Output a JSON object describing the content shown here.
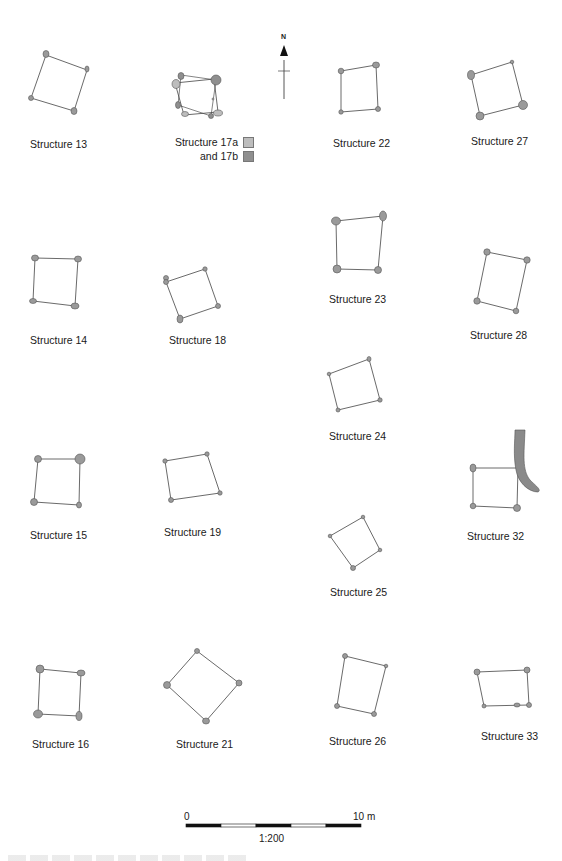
{
  "figure": {
    "north_arrow": {
      "label": "N"
    },
    "colors": {
      "post_fill": "#9a9a9a",
      "post_stroke": "#555555",
      "outline": "#444444",
      "structure_17a": "#bdbdbd",
      "structure_17b": "#8f8f8f",
      "ditch": "#8a8a8a"
    },
    "structures": [
      {
        "id": "13",
        "label": "Structure 13",
        "label_x": 30,
        "label_y": 138
      },
      {
        "id": "17",
        "label": "Structure 17a",
        "label2": "and 17b",
        "label_x": 167,
        "label_y": 137
      },
      {
        "id": "22",
        "label": "Structure 22",
        "label_x": 333,
        "label_y": 137
      },
      {
        "id": "27",
        "label": "Structure 27",
        "label_x": 471,
        "label_y": 135
      },
      {
        "id": "14",
        "label": "Structure 14",
        "label_x": 30,
        "label_y": 334
      },
      {
        "id": "18",
        "label": "Structure 18",
        "label_x": 169,
        "label_y": 334
      },
      {
        "id": "23",
        "label": "Structure 23",
        "label_x": 329,
        "label_y": 293
      },
      {
        "id": "28",
        "label": "Structure 28",
        "label_x": 470,
        "label_y": 329
      },
      {
        "id": "24",
        "label": "Structure 24",
        "label_x": 329,
        "label_y": 430
      },
      {
        "id": "15",
        "label": "Structure 15",
        "label_x": 30,
        "label_y": 529
      },
      {
        "id": "19",
        "label": "Structure 19",
        "label_x": 164,
        "label_y": 526
      },
      {
        "id": "32",
        "label": "Structure 32",
        "label_x": 467,
        "label_y": 530
      },
      {
        "id": "25",
        "label": "Structure 25",
        "label_x": 330,
        "label_y": 586
      },
      {
        "id": "16",
        "label": "Structure 16",
        "label_x": 32,
        "label_y": 738
      },
      {
        "id": "21",
        "label": "Structure 21",
        "label_x": 176,
        "label_y": 738
      },
      {
        "id": "26",
        "label": "Structure 26",
        "label_x": 329,
        "label_y": 735
      },
      {
        "id": "33",
        "label": "Structure 33",
        "label_x": 481,
        "label_y": 730
      }
    ],
    "scale_bar": {
      "start_label": "0",
      "end_label": "10 m",
      "ratio_label": "1:200"
    }
  }
}
